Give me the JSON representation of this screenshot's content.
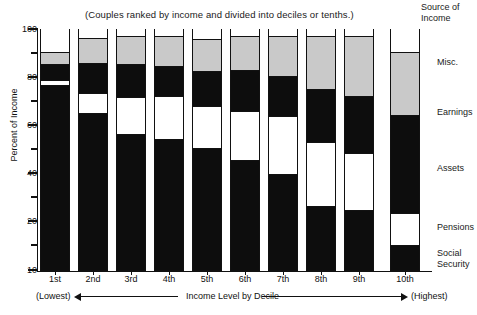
{
  "subtitle": "(Couples ranked by income and divided into deciles or tenths.)",
  "legend_heading_line1": "Source of",
  "legend_heading_line2": "Income",
  "axis": {
    "ylabel": "Percent of Income",
    "xlabel": "Income Level by Decile",
    "x_low_note": "(Lowest)",
    "x_high_note": "(Highest)"
  },
  "legend": [
    {
      "label": "Misc.",
      "color": "#ffffff",
      "top_px": 57
    },
    {
      "label": "Earnings",
      "color": "#c9c9c9",
      "top_px": 107
    },
    {
      "label": "Assets",
      "color": "#0d0d0d",
      "top_px": 163
    },
    {
      "label": "Pensions",
      "color": "#ffffff",
      "top_px": 222
    },
    {
      "label": "Social",
      "label2": "Security",
      "color": "#0d0d0d",
      "top_px": 248
    }
  ],
  "chart_data": {
    "type": "bar",
    "stacked": true,
    "title": "(Couples ranked by income and divided into deciles or tenths.)",
    "xlabel": "Income Level by Decile",
    "ylabel": "Percent of Income",
    "ylim": [
      10,
      100
    ],
    "yticks": [
      10,
      20,
      40,
      60,
      80,
      100
    ],
    "yticks_minor": [
      30,
      50,
      70,
      90
    ],
    "grid": false,
    "legend_position": "right",
    "categories": [
      "1st",
      "2nd",
      "3rd",
      "4th",
      "5th",
      "6th",
      "7th",
      "8th",
      "9th",
      "10th"
    ],
    "series": [
      {
        "name": "Social Security",
        "color": "#0d0d0d",
        "values": [
          68.2,
          56.5,
          44.0,
          43.5,
          37.5,
          31.0,
          24.5,
          14.0,
          13.5,
          10.5
        ]
      },
      {
        "name": "Pensions",
        "color": "#ffffff",
        "values": [
          2.0,
          7.5,
          13.8,
          16.0,
          15.7,
          18.3,
          21.6,
          23.9,
          21.3,
          11.9
        ]
      },
      {
        "name": "Assets",
        "color": "#0d0d0d",
        "values": [
          6.0,
          11.2,
          12.3,
          11.2,
          13.1,
          15.3,
          14.9,
          19.8,
          21.3,
          36.6
        ]
      },
      {
        "name": "Earnings",
        "color": "#c9c9c9",
        "values": [
          4.5,
          9.3,
          10.4,
          11.2,
          12.0,
          12.7,
          14.9,
          19.8,
          22.4,
          23.5
        ]
      },
      {
        "name": "Misc.",
        "color": "#ffffff",
        "values": [
          8.6,
          3.4,
          2.6,
          2.6,
          3.7,
          2.6,
          2.6,
          2.6,
          2.6,
          8.6
        ]
      }
    ]
  },
  "bars": [
    {
      "label": "1st",
      "x": 40,
      "segments": [
        {
          "name": "Misc.",
          "top": 29,
          "bottom": 52,
          "fill": "white"
        },
        {
          "name": "Earnings",
          "top": 52,
          "bottom": 64,
          "fill": "gray"
        },
        {
          "name": "Assets",
          "top": 64,
          "bottom": 80,
          "fill": "dark"
        },
        {
          "name": "Pensions",
          "top": 80,
          "bottom": 85,
          "fill": "white"
        },
        {
          "name": "Social Security",
          "top": 85,
          "bottom": 270,
          "fill": "dark"
        }
      ]
    },
    {
      "label": "2nd",
      "x": 78,
      "segments": [
        {
          "name": "Misc.",
          "top": 29,
          "bottom": 38,
          "fill": "white"
        },
        {
          "name": "Earnings",
          "top": 38,
          "bottom": 63,
          "fill": "gray"
        },
        {
          "name": "Assets",
          "top": 63,
          "bottom": 93,
          "fill": "dark"
        },
        {
          "name": "Pensions",
          "top": 93,
          "bottom": 113,
          "fill": "white"
        },
        {
          "name": "Social Security",
          "top": 113,
          "bottom": 270,
          "fill": "dark"
        }
      ]
    },
    {
      "label": "3rd",
      "x": 116,
      "segments": [
        {
          "name": "Misc.",
          "top": 29,
          "bottom": 36,
          "fill": "white"
        },
        {
          "name": "Earnings",
          "top": 36,
          "bottom": 64,
          "fill": "gray"
        },
        {
          "name": "Assets",
          "top": 64,
          "bottom": 97,
          "fill": "dark"
        },
        {
          "name": "Pensions",
          "top": 97,
          "bottom": 134,
          "fill": "white"
        },
        {
          "name": "Social Security",
          "top": 134,
          "bottom": 270,
          "fill": "dark"
        }
      ]
    },
    {
      "label": "4th",
      "x": 154,
      "segments": [
        {
          "name": "Misc.",
          "top": 29,
          "bottom": 36,
          "fill": "white"
        },
        {
          "name": "Earnings",
          "top": 36,
          "bottom": 66,
          "fill": "gray"
        },
        {
          "name": "Assets",
          "top": 66,
          "bottom": 96,
          "fill": "dark"
        },
        {
          "name": "Pensions",
          "top": 96,
          "bottom": 139,
          "fill": "white"
        },
        {
          "name": "Social Security",
          "top": 139,
          "bottom": 270,
          "fill": "dark"
        }
      ]
    },
    {
      "label": "5th",
      "x": 192,
      "segments": [
        {
          "name": "Misc.",
          "top": 29,
          "bottom": 39,
          "fill": "white"
        },
        {
          "name": "Earnings",
          "top": 39,
          "bottom": 71,
          "fill": "gray"
        },
        {
          "name": "Assets",
          "top": 71,
          "bottom": 106,
          "fill": "dark"
        },
        {
          "name": "Pensions",
          "top": 106,
          "bottom": 148,
          "fill": "white"
        },
        {
          "name": "Social Security",
          "top": 148,
          "bottom": 270,
          "fill": "dark"
        }
      ]
    },
    {
      "label": "6th",
      "x": 230,
      "segments": [
        {
          "name": "Misc.",
          "top": 29,
          "bottom": 36,
          "fill": "white"
        },
        {
          "name": "Earnings",
          "top": 36,
          "bottom": 70,
          "fill": "gray"
        },
        {
          "name": "Assets",
          "top": 70,
          "bottom": 111,
          "fill": "dark"
        },
        {
          "name": "Pensions",
          "top": 111,
          "bottom": 160,
          "fill": "white"
        },
        {
          "name": "Social Security",
          "top": 160,
          "bottom": 270,
          "fill": "dark"
        }
      ]
    },
    {
      "label": "7th",
      "x": 268,
      "segments": [
        {
          "name": "Misc.",
          "top": 29,
          "bottom": 36,
          "fill": "white"
        },
        {
          "name": "Earnings",
          "top": 36,
          "bottom": 76,
          "fill": "gray"
        },
        {
          "name": "Assets",
          "top": 76,
          "bottom": 116,
          "fill": "dark"
        },
        {
          "name": "Pensions",
          "top": 116,
          "bottom": 174,
          "fill": "white"
        },
        {
          "name": "Social Security",
          "top": 174,
          "bottom": 270,
          "fill": "dark"
        }
      ]
    },
    {
      "label": "8th",
      "x": 306,
      "segments": [
        {
          "name": "Misc.",
          "top": 29,
          "bottom": 36,
          "fill": "white"
        },
        {
          "name": "Earnings",
          "top": 36,
          "bottom": 89,
          "fill": "gray"
        },
        {
          "name": "Assets",
          "top": 89,
          "bottom": 142,
          "fill": "dark"
        },
        {
          "name": "Pensions",
          "top": 142,
          "bottom": 206,
          "fill": "white"
        },
        {
          "name": "Social Security",
          "top": 206,
          "bottom": 270,
          "fill": "dark"
        }
      ]
    },
    {
      "label": "9th",
      "x": 344,
      "segments": [
        {
          "name": "Misc.",
          "top": 29,
          "bottom": 36,
          "fill": "white"
        },
        {
          "name": "Earnings",
          "top": 36,
          "bottom": 96,
          "fill": "gray"
        },
        {
          "name": "Assets",
          "top": 96,
          "bottom": 153,
          "fill": "dark"
        },
        {
          "name": "Pensions",
          "top": 153,
          "bottom": 210,
          "fill": "white"
        },
        {
          "name": "Social Security",
          "top": 210,
          "bottom": 270,
          "fill": "dark"
        }
      ]
    },
    {
      "label": "10th",
      "x": 390,
      "segments": [
        {
          "name": "Misc.",
          "top": 29,
          "bottom": 52,
          "fill": "white"
        },
        {
          "name": "Earnings",
          "top": 52,
          "bottom": 115,
          "fill": "gray"
        },
        {
          "name": "Assets",
          "top": 115,
          "bottom": 213,
          "fill": "dark"
        },
        {
          "name": "Pensions",
          "top": 213,
          "bottom": 245,
          "fill": "white"
        },
        {
          "name": "Social Security",
          "top": 245,
          "bottom": 270,
          "fill": "dark"
        }
      ]
    }
  ],
  "yticks": [
    {
      "value": "100",
      "y": 29,
      "major": true
    },
    {
      "value": "",
      "y": 53,
      "major": false
    },
    {
      "value": "80",
      "y": 77,
      "major": true
    },
    {
      "value": "",
      "y": 101,
      "major": false
    },
    {
      "value": "60",
      "y": 125,
      "major": true
    },
    {
      "value": "",
      "y": 149,
      "major": false
    },
    {
      "value": "40",
      "y": 173,
      "major": true
    },
    {
      "value": "",
      "y": 197,
      "major": false
    },
    {
      "value": "20",
      "y": 221,
      "major": true
    },
    {
      "value": "",
      "y": 245,
      "major": false
    },
    {
      "value": "10",
      "y": 270,
      "major": true
    }
  ]
}
